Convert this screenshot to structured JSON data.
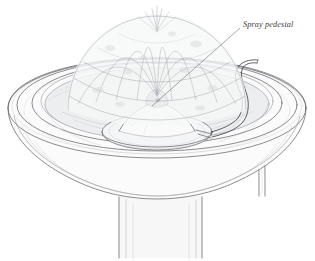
{
  "figure": {
    "style": "pen-and-ink line drawing with light gray wash",
    "background_color": "#ffffff",
    "ink_color": "#5b5b60"
  },
  "annotations": [
    {
      "id": "spray-pedestal",
      "label": "Spray pedestal",
      "text_position": {
        "x": 243,
        "y": 24
      },
      "leader_from": {
        "x": 240,
        "y": 28
      },
      "leader_to": {
        "x": 152,
        "y": 106
      },
      "font_style": "italic serif",
      "font_size_px": 8.2,
      "color": "#3c3c40"
    }
  ],
  "parts": [
    {
      "name": "bowl-rim",
      "description": "wide circular basin rim drawn as nested ellipses"
    },
    {
      "name": "bowl-basin",
      "description": "inner water-filled basin"
    },
    {
      "name": "water-surface",
      "description": "still water inside basin"
    },
    {
      "name": "spray-pedestal",
      "description": "low dome with nozzle at center of basin"
    },
    {
      "name": "pedestal-disc",
      "description": "flat circular plate supporting the pedestal"
    },
    {
      "name": "nozzle",
      "description": "dark spray outlet at pedestal apex"
    },
    {
      "name": "supply-pipe",
      "description": "curved pipe arcing over right rim into basin"
    },
    {
      "name": "water-spray",
      "description": "domed umbrella of water jets rising from nozzle"
    },
    {
      "name": "support-column",
      "description": "rectangular pedestal column below the bowl"
    }
  ],
  "colors": {
    "ink": "#5b5b60",
    "ink_soft": "#8d8d93",
    "ink_fine": "#a6a6ac",
    "nozzle": "#1c1c1f",
    "water_wash": "#eceef0",
    "background": "#ffffff"
  }
}
